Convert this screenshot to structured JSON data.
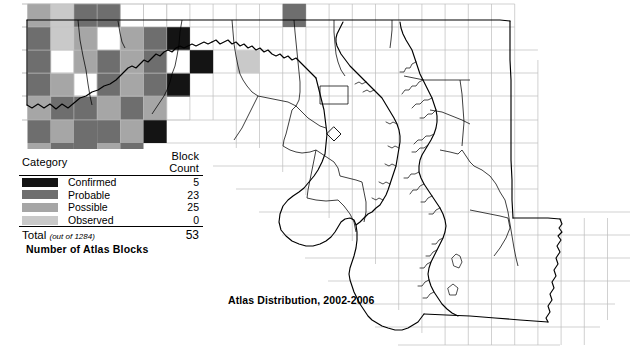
{
  "figure": {
    "title": "Atlas Distribution, 2002-2006",
    "caption": "Number of Atlas Blocks",
    "region": "Maryland"
  },
  "legend": {
    "header": {
      "category": "Category",
      "count": "Block Count"
    },
    "rows": [
      {
        "label": "Confirmed",
        "count": "5",
        "color": "#141414"
      },
      {
        "label": "Probable",
        "count": "23",
        "color": "#6e6e6e"
      },
      {
        "label": "Possible",
        "count": "25",
        "color": "#a6a6a6"
      },
      {
        "label": "Observed",
        "count": "0",
        "color": "#c9c9c9"
      }
    ],
    "total": {
      "label": "Total",
      "note": "(out of 1284)",
      "count": "53"
    }
  },
  "colors": {
    "confirmed": "#141414",
    "probable": "#6e6e6e",
    "possible": "#a6a6a6",
    "observed": "#c9c9c9",
    "grid": "#b9b9b9",
    "state_outline": "#000000",
    "county_outline": "#000000",
    "background": "#ffffff"
  },
  "chart_data": {
    "type": "map",
    "title": "Atlas Distribution, 2002-2006",
    "subtitle": "Number of Atlas Blocks",
    "region": "Maryland",
    "grid": {
      "cell_size_px": 23.2,
      "origin_x_px": 27.5,
      "origin_y_px": 27.0,
      "note": "Atlas block grid overlay across the state"
    },
    "categories": [
      "Confirmed",
      "Probable",
      "Possible",
      "Observed"
    ],
    "values": [
      5,
      23,
      25,
      0
    ],
    "total": 53,
    "total_blocks_available": 1284,
    "blocks": [
      {
        "col": 0,
        "row": -1,
        "cat": "possible"
      },
      {
        "col": 1,
        "row": -1,
        "cat": "observed"
      },
      {
        "col": 2,
        "row": -1,
        "cat": "probable"
      },
      {
        "col": 3,
        "row": -1,
        "cat": "probable"
      },
      {
        "col": 11,
        "row": -1,
        "cat": "probable"
      },
      {
        "col": 0,
        "row": 0,
        "cat": "probable"
      },
      {
        "col": 1,
        "row": 0,
        "cat": "observed"
      },
      {
        "col": 2,
        "row": 0,
        "cat": "possible"
      },
      {
        "col": 4,
        "row": 0,
        "cat": "possible"
      },
      {
        "col": 5,
        "row": 0,
        "cat": "probable"
      },
      {
        "col": 6,
        "row": 0,
        "cat": "confirmed"
      },
      {
        "col": 0,
        "row": 1,
        "cat": "probable"
      },
      {
        "col": 2,
        "row": 1,
        "cat": "possible"
      },
      {
        "col": 3,
        "row": 1,
        "cat": "probable"
      },
      {
        "col": 4,
        "row": 1,
        "cat": "possible"
      },
      {
        "col": 5,
        "row": 1,
        "cat": "probable"
      },
      {
        "col": 7,
        "row": 1,
        "cat": "confirmed"
      },
      {
        "col": 9,
        "row": 1,
        "cat": "observed"
      },
      {
        "col": 0,
        "row": 2,
        "cat": "probable"
      },
      {
        "col": 1,
        "row": 2,
        "cat": "possible"
      },
      {
        "col": 3,
        "row": 2,
        "cat": "probable"
      },
      {
        "col": 4,
        "row": 2,
        "cat": "possible"
      },
      {
        "col": 5,
        "row": 2,
        "cat": "probable"
      },
      {
        "col": 6,
        "row": 2,
        "cat": "confirmed"
      },
      {
        "col": 0,
        "row": 3,
        "cat": "possible"
      },
      {
        "col": 1,
        "row": 3,
        "cat": "probable"
      },
      {
        "col": 2,
        "row": 3,
        "cat": "probable"
      },
      {
        "col": 3,
        "row": 3,
        "cat": "possible"
      },
      {
        "col": 4,
        "row": 3,
        "cat": "probable"
      },
      {
        "col": 5,
        "row": 3,
        "cat": "possible"
      },
      {
        "col": 0,
        "row": 4,
        "cat": "probable"
      },
      {
        "col": 1,
        "row": 4,
        "cat": "possible"
      },
      {
        "col": 2,
        "row": 4,
        "cat": "probable"
      },
      {
        "col": 3,
        "row": 4,
        "cat": "probable"
      },
      {
        "col": 4,
        "row": 4,
        "cat": "possible"
      },
      {
        "col": 5,
        "row": 4,
        "cat": "confirmed"
      },
      {
        "col": 0,
        "row": 5,
        "cat": "possible"
      },
      {
        "col": 1,
        "row": 5,
        "cat": "probable"
      },
      {
        "col": 2,
        "row": 5,
        "cat": "probable"
      },
      {
        "col": 3,
        "row": 5,
        "cat": "possible"
      },
      {
        "col": 4,
        "row": 5,
        "cat": "probable"
      },
      {
        "col": 0,
        "row": 6,
        "cat": "observed"
      },
      {
        "col": 1,
        "row": 6,
        "cat": "possible"
      },
      {
        "col": 2,
        "row": 6,
        "cat": "probable"
      },
      {
        "col": 3,
        "row": 6,
        "cat": "possible"
      },
      {
        "col": 0,
        "row": 7,
        "cat": "possible"
      },
      {
        "col": 1,
        "row": 7,
        "cat": "probable"
      },
      {
        "col": 2,
        "row": 7,
        "cat": "possible"
      },
      {
        "col": 1,
        "row": 8,
        "cat": "confirmed"
      },
      {
        "col": 2,
        "row": 8,
        "cat": "possible"
      }
    ]
  }
}
